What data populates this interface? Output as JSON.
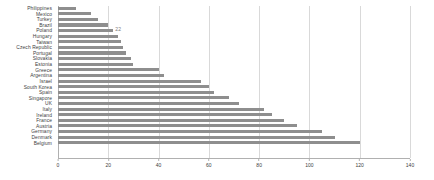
{
  "chart_data": {
    "type": "bar",
    "orientation": "horizontal",
    "title": "",
    "subtitle": "",
    "xlabel": "",
    "ylabel": "",
    "xlim": [
      0,
      140
    ],
    "xticks": [
      0,
      20,
      40,
      60,
      80,
      100,
      120,
      140
    ],
    "grid": true,
    "legend": false,
    "bar_color": "#8e8e8e",
    "grid_color": "#d9d9d9",
    "axis_color": "#b0b0b0",
    "annotations": [
      {
        "category": "Poland",
        "text": "22"
      }
    ],
    "categories": [
      "Philippines",
      "Mexico",
      "Turkey",
      "Brazil",
      "Poland",
      "Hungary",
      "Taiwan",
      "Czech Republic",
      "Portugal",
      "Slovakia",
      "Estonia",
      "Greece",
      "Argentina",
      "Israel",
      "South Korea",
      "Spain",
      "Singapore",
      "UK",
      "Italy",
      "Ireland",
      "France",
      "Austria",
      "Germany",
      "Denmark",
      "Belgium"
    ],
    "values": [
      7,
      13,
      16,
      20,
      22,
      24,
      25,
      26,
      27,
      29,
      30,
      40,
      42,
      57,
      60,
      62,
      68,
      72,
      82,
      85,
      90,
      95,
      105,
      110,
      120
    ],
    "data_labels": [
      "",
      "",
      "",
      "",
      "22",
      "",
      "",
      "",
      "",
      "",
      "",
      "",
      "",
      "",
      "",
      "",
      "",
      "",
      "",
      "",
      "",
      "",
      "",
      "",
      ""
    ]
  }
}
